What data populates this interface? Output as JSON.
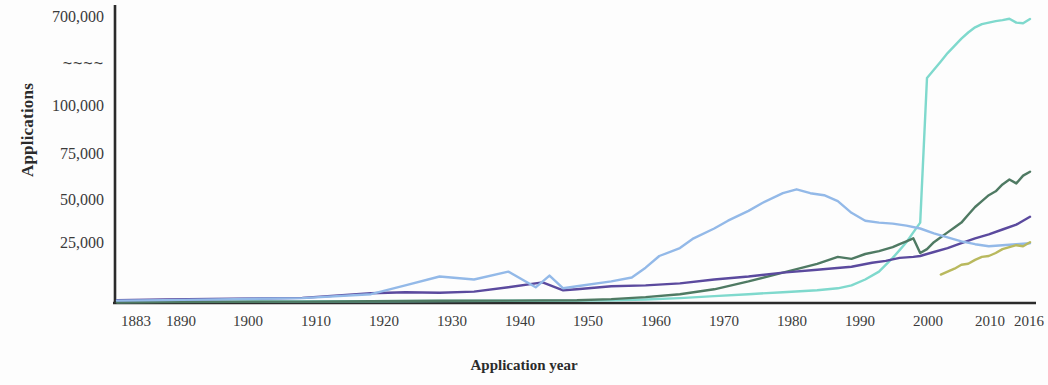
{
  "chart_data": {
    "type": "line",
    "title": "",
    "xlabel": "Application year",
    "ylabel": "Applications",
    "axis_break": "~~~~",
    "axis_break_note": "y-axis has a scale break between 100,000 and 700,000",
    "grid": false,
    "legend_position": "none",
    "xlim": [
      1883,
      2016
    ],
    "ylim": [
      0,
      700000
    ],
    "xticks": [
      "1883",
      "1890",
      "1900",
      "1910",
      "1920",
      "1930",
      "1940",
      "1950",
      "1960",
      "1970",
      "1980",
      "1990",
      "2000",
      "2010",
      "2016"
    ],
    "xtick_values": [
      1883,
      1890,
      1900,
      1910,
      1920,
      1930,
      1940,
      1950,
      1960,
      1970,
      1980,
      1990,
      2000,
      2010,
      2016
    ],
    "yticks": [
      "25,000",
      "50,000",
      "75,000",
      "100,000",
      "~~~~",
      "700,000"
    ],
    "ytick_values": [
      25000,
      50000,
      75000,
      100000,
      null,
      700000
    ],
    "colors": {
      "series_1": "#7fd9cd",
      "series_2": "#4f7a63",
      "series_3": "#5b4a9e",
      "series_4": "#93b9e8",
      "series_5": "#b9b95e",
      "axis": "#2b2b2b",
      "background": "#fdfdfd"
    },
    "series": [
      {
        "name": "series_1",
        "color": "#7fd9cd",
        "x": [
          1883,
          1890,
          1900,
          1910,
          1920,
          1930,
          1940,
          1950,
          1955,
          1960,
          1965,
          1970,
          1975,
          1980,
          1985,
          1988,
          1990,
          1992,
          1994,
          1996,
          1997,
          1998,
          1999,
          2000,
          2001,
          2002,
          2003,
          2004,
          2005,
          2006,
          2007,
          2008,
          2009,
          2010,
          2011,
          2012,
          2013,
          2014,
          2015,
          2016
        ],
        "y": [
          500,
          600,
          700,
          800,
          900,
          1000,
          1100,
          1200,
          1400,
          1800,
          2500,
          3500,
          4500,
          5500,
          6500,
          7500,
          9000,
          12000,
          16000,
          23000,
          27000,
          31000,
          36000,
          41000,
          120000,
          200000,
          280000,
          360000,
          430000,
          500000,
          560000,
          610000,
          640000,
          655000,
          670000,
          680000,
          692000,
          655000,
          650000,
          690000
        ]
      },
      {
        "name": "series_2",
        "color": "#4f7a63",
        "x": [
          1883,
          1890,
          1900,
          1910,
          1920,
          1930,
          1940,
          1950,
          1955,
          1960,
          1965,
          1970,
          1975,
          1980,
          1985,
          1988,
          1990,
          1992,
          1994,
          1996,
          1997,
          1998,
          1999,
          2000,
          2001,
          2002,
          2003,
          2004,
          2005,
          2006,
          2007,
          2008,
          2009,
          2010,
          2011,
          2012,
          2013,
          2014,
          2015,
          2016
        ],
        "y": [
          400,
          500,
          600,
          700,
          900,
          1100,
          1200,
          1400,
          2000,
          3000,
          4500,
          7000,
          11000,
          15500,
          20000,
          23500,
          22500,
          25000,
          26500,
          28500,
          30000,
          31500,
          33000,
          25500,
          27500,
          31000,
          33500,
          36000,
          38500,
          41000,
          45000,
          49000,
          52000,
          55000,
          57000,
          60500,
          63000,
          61000,
          65000,
          67000
        ]
      },
      {
        "name": "series_3",
        "color": "#5b4a9e",
        "x": [
          1883,
          1890,
          1900,
          1910,
          1920,
          1925,
          1930,
          1935,
          1940,
          1945,
          1948,
          1950,
          1955,
          1960,
          1965,
          1970,
          1975,
          1980,
          1985,
          1990,
          1993,
          1995,
          1997,
          1999,
          2000,
          2002,
          2004,
          2006,
          2008,
          2010,
          2012,
          2014,
          2015,
          2016
        ],
        "y": [
          1500,
          1800,
          2200,
          2600,
          5000,
          5500,
          5200,
          5800,
          8000,
          10500,
          6500,
          7000,
          8500,
          9000,
          10000,
          12000,
          13500,
          15500,
          17000,
          18500,
          20500,
          21500,
          23000,
          23500,
          24000,
          26000,
          28000,
          30500,
          33000,
          35000,
          37500,
          40000,
          42000,
          44000
        ]
      },
      {
        "name": "series_4",
        "color": "#93b9e8",
        "x": [
          1883,
          1890,
          1900,
          1910,
          1920,
          1925,
          1930,
          1935,
          1940,
          1944,
          1946,
          1948,
          1950,
          1955,
          1958,
          1960,
          1962,
          1965,
          1967,
          1970,
          1972,
          1975,
          1977,
          1980,
          1982,
          1984,
          1986,
          1988,
          1990,
          1992,
          1994,
          1996,
          1998,
          2000,
          2002,
          2004,
          2006,
          2008,
          2010,
          2012,
          2014,
          2016
        ],
        "y": [
          1200,
          1500,
          2000,
          2500,
          4500,
          9000,
          13500,
          12000,
          16000,
          8000,
          14000,
          7500,
          8500,
          11000,
          13000,
          18000,
          24000,
          28000,
          33000,
          38000,
          42000,
          47000,
          51000,
          56000,
          58000,
          56000,
          55000,
          52000,
          46000,
          42000,
          41000,
          40500,
          39500,
          38000,
          35500,
          33500,
          31500,
          30000,
          29000,
          29500,
          30000,
          30500
        ]
      },
      {
        "name": "series_5",
        "color": "#b9b95e",
        "x": [
          2003,
          2004,
          2005,
          2006,
          2007,
          2008,
          2009,
          2010,
          2011,
          2012,
          2013,
          2014,
          2015,
          2016
        ],
        "y": [
          14500,
          16000,
          17500,
          19500,
          20000,
          22000,
          23500,
          24000,
          25500,
          27500,
          28500,
          29500,
          29000,
          31000
        ]
      }
    ]
  },
  "axis": {
    "y_title": "Applications",
    "x_title": "Application year"
  }
}
